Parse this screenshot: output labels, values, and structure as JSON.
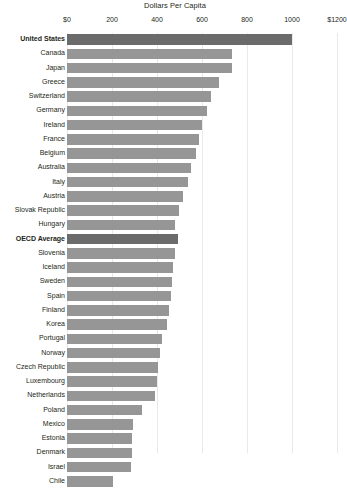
{
  "chart_data": {
    "type": "bar",
    "orientation": "horizontal",
    "title": "Dollars Per Capita",
    "xlabel": "",
    "ylabel": "",
    "xlim": [
      0,
      1200
    ],
    "grid": true,
    "legend": false,
    "tick_labels": [
      "$0",
      "200",
      "400",
      "600",
      "800",
      "1000",
      "$1200"
    ],
    "tick_values": [
      0,
      200,
      400,
      600,
      800,
      1000,
      1200
    ],
    "categories": [
      "United States",
      "Canada",
      "Japan",
      "Greece",
      "Switzerland",
      "Germany",
      "Ireland",
      "France",
      "Belgium",
      "Australia",
      "Italy",
      "Austria",
      "Slovak Republic",
      "Hungary",
      "OECD Average",
      "Slovenia",
      "Iceland",
      "Sweden",
      "Spain",
      "Finland",
      "Korea",
      "Portugal",
      "Norway",
      "Czech Republic",
      "Luxembourg",
      "Netherlands",
      "Poland",
      "Mexico",
      "Estonia",
      "Denmark",
      "Israel",
      "Chile"
    ],
    "values": [
      1000,
      733,
      733,
      675,
      640,
      620,
      600,
      587,
      573,
      551,
      538,
      516,
      498,
      480,
      493,
      480,
      471,
      467,
      462,
      453,
      444,
      422,
      413,
      404,
      400,
      391,
      333,
      293,
      289,
      289,
      284,
      204
    ],
    "highlighted": [
      "United States",
      "OECD Average"
    ],
    "colors": {
      "bar": "#969696",
      "bar_highlight": "#6b6b6b",
      "grid": "#e9e9e9",
      "text": "#231f20",
      "background": "#ffffff"
    }
  }
}
